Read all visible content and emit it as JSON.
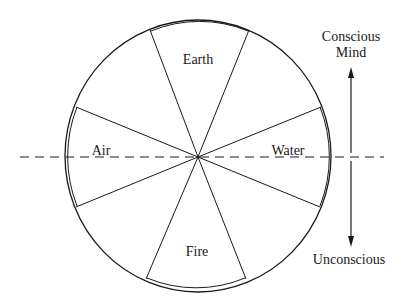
{
  "diagram": {
    "elements": [
      {
        "name": "Earth",
        "position": "top"
      },
      {
        "name": "Air",
        "position": "left"
      },
      {
        "name": "Water",
        "position": "right"
      },
      {
        "name": "Fire",
        "position": "bottom"
      }
    ],
    "axis": {
      "top_label_line1": "Conscious",
      "top_label_line2": "Mind",
      "bottom_label": "Unconscious"
    },
    "colors": {
      "ink": "#1a1a1a",
      "background": "#ffffff"
    }
  }
}
